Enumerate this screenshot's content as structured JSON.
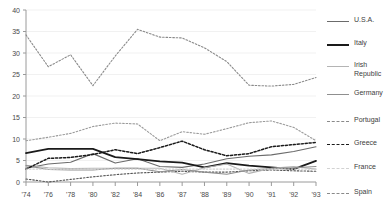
{
  "chart_data": {
    "type": "line",
    "title": "",
    "xlabel": "",
    "ylabel": "",
    "ylim": [
      0,
      40
    ],
    "yticks": [
      0,
      5,
      10,
      15,
      20,
      25,
      30,
      35,
      40
    ],
    "grid": true,
    "legend_position": "right",
    "x": [
      "'74",
      "'76",
      "'78",
      "'80",
      "'82",
      "'84",
      "'86",
      "'87",
      "'88",
      "'89",
      "'90",
      "'91",
      "'92",
      "'93"
    ],
    "series": [
      {
        "name": "U.S.A.",
        "color": "#6b6b6b",
        "style": "solid",
        "width": 1.1,
        "values": [
          3.2,
          4.2,
          4.6,
          6.6,
          4.4,
          5.4,
          3.6,
          3.4,
          4.2,
          5.4,
          6.0,
          6.3,
          7.1,
          8.2
        ]
      },
      {
        "name": "Italy",
        "color": "#1a1a1a",
        "style": "solid",
        "width": 1.8,
        "values": [
          6.7,
          7.7,
          7.7,
          7.7,
          5.8,
          5.3,
          4.8,
          4.5,
          3.4,
          4.4,
          3.8,
          3.4,
          3.0,
          4.9
        ]
      },
      {
        "name": "Irish\nRepublic",
        "color": "#b4b4b4",
        "style": "solid",
        "width": 1.1,
        "values": [
          3.9,
          3.3,
          3.1,
          3.2,
          3.2,
          3.2,
          3.2,
          1.8,
          3.3,
          4.2,
          2.0,
          3.2,
          3.6,
          3.0
        ]
      },
      {
        "name": "Germany",
        "color": "#8f8f8f",
        "style": "solid",
        "width": 1.1,
        "values": [
          3.8,
          2.9,
          2.8,
          2.8,
          3.2,
          3.2,
          2.4,
          2.9,
          2.3,
          1.8,
          2.8,
          3.1,
          3.3,
          3.6
        ]
      },
      {
        "name": "Portugal",
        "color": "#9b9b9b",
        "style": "dashed",
        "width": 1.1,
        "values": [
          9.6,
          10.4,
          11.3,
          12.9,
          13.7,
          13.5,
          9.6,
          11.7,
          11.1,
          12.4,
          13.8,
          14.2,
          12.7,
          9.6
        ]
      },
      {
        "name": "Greece",
        "color": "#1a1a1a",
        "style": "dashed",
        "width": 1.5,
        "values": [
          3.0,
          5.5,
          5.7,
          6.4,
          7.5,
          6.6,
          8.0,
          9.5,
          7.5,
          6.1,
          6.6,
          8.2,
          8.7,
          9.2
        ]
      },
      {
        "name": "France",
        "color": "#d2d2d2",
        "style": "dashed",
        "width": 1.1,
        "values": [
          3.0,
          3.0,
          3.0,
          3.0,
          3.0,
          3.0,
          3.0,
          3.0,
          3.0,
          3.0,
          3.0,
          3.0,
          3.0,
          3.0
        ]
      },
      {
        "name": "Spain",
        "color": "#8a8a8a",
        "style": "dashed",
        "width": 1.1,
        "values": [
          34.2,
          26.8,
          29.6,
          22.4,
          29.3,
          35.5,
          33.7,
          33.5,
          31.2,
          28.0,
          22.5,
          22.3,
          22.7,
          24.3
        ]
      }
    ],
    "extra_series": [
      {
        "name": "spain-lower-dashed",
        "color": "#555555",
        "style": "dashed",
        "width": 1.1,
        "values": [
          0.7,
          0.0,
          0.6,
          1.2,
          1.7,
          2.1,
          2.3,
          2.5,
          2.3,
          2.3,
          2.6,
          2.8,
          2.6,
          2.5
        ]
      }
    ]
  },
  "legend": {
    "items": [
      {
        "label": "U.S.A.",
        "color": "#6b6b6b",
        "style": "solid",
        "width": 1.1
      },
      {
        "label": "Italy",
        "color": "#1a1a1a",
        "style": "solid",
        "width": 2
      },
      {
        "label": "Irish\nRepublic",
        "color": "#b4b4b4",
        "style": "solid",
        "width": 1.1
      },
      {
        "label": "Germany",
        "color": "#8f8f8f",
        "style": "solid",
        "width": 1.1
      },
      {
        "label": "Portugal",
        "color": "#8a8a8a",
        "style": "dashed",
        "width": 1.1
      },
      {
        "label": "Greece",
        "color": "#1a1a1a",
        "style": "dashed",
        "width": 1.6
      },
      {
        "label": "France",
        "color": "#d2d2d2",
        "style": "dashed",
        "width": 1.1
      },
      {
        "label": "Spain",
        "color": "#8a8a8a",
        "style": "dashed",
        "width": 1.1
      }
    ]
  }
}
